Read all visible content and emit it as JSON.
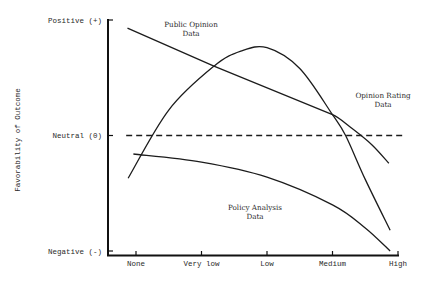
{
  "chart_data": {
    "type": "line",
    "title": "",
    "xlabel": "",
    "ylabel": "Favorability of Outcome",
    "x_categories": [
      "None",
      "Very low",
      "Low",
      "Medium",
      "High"
    ],
    "xlim": [
      0,
      4
    ],
    "y_tick_labels": [
      {
        "label": "Positive (+)",
        "value": 1
      },
      {
        "label": "Neutral (0)",
        "value": 0
      },
      {
        "label": "Negative (-)",
        "value": -1
      }
    ],
    "ylim": [
      -1,
      1
    ],
    "grid": false,
    "series": [
      {
        "name": "Opinion Rating Data",
        "label_lines": [
          "Opinion Rating",
          "Data"
        ],
        "style": "solid",
        "points": [
          [
            -0.13,
            0.93
          ],
          [
            1.19,
            0.6
          ],
          [
            3.0,
            0.18
          ],
          [
            3.3,
            0.06
          ],
          [
            3.6,
            -0.08
          ],
          [
            3.86,
            -0.24
          ]
        ]
      },
      {
        "name": "Public Opinion Data",
        "label_lines": [
          "Public Opinion",
          "Data"
        ],
        "style": "solid",
        "points": [
          [
            -0.12,
            -0.37
          ],
          [
            0.5,
            0.22
          ],
          [
            1.19,
            0.6
          ],
          [
            1.6,
            0.73
          ],
          [
            2.0,
            0.76
          ],
          [
            2.5,
            0.58
          ],
          [
            3.0,
            0.18
          ],
          [
            3.2,
            0.0
          ],
          [
            3.5,
            -0.38
          ],
          [
            3.88,
            -0.82
          ]
        ]
      },
      {
        "name": "Policy Analysis Data",
        "label_lines": [
          "Policy Analysis",
          "Data"
        ],
        "style": "solid",
        "points": [
          [
            -0.04,
            -0.16
          ],
          [
            1.0,
            -0.23
          ],
          [
            2.0,
            -0.36
          ],
          [
            3.0,
            -0.6
          ],
          [
            3.5,
            -0.8
          ],
          [
            3.88,
            -1.0
          ]
        ]
      },
      {
        "name": "Neutral baseline",
        "style": "dashed",
        "points": [
          [
            -0.15,
            0.0
          ],
          [
            4.1,
            0.0
          ]
        ]
      }
    ]
  }
}
